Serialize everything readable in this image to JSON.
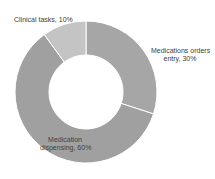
{
  "chart_data": {
    "type": "pie",
    "donut": true,
    "title": "",
    "categories": [
      "Medications orders entry",
      "Medication dispensing",
      "Clinical tasks"
    ],
    "values": [
      30,
      60,
      10
    ],
    "unit": "%",
    "colors": [
      "#a6a6a6",
      "#a0a0a0",
      "#c4c4c4"
    ],
    "labels": [
      {
        "line1": "Medications orders",
        "line2": "entry, 30%"
      },
      {
        "line1": "Medication",
        "line2": "dispensing, 60%"
      },
      {
        "line1": "Clinical tasks, 10%",
        "line2": ""
      }
    ],
    "legend": "none"
  }
}
